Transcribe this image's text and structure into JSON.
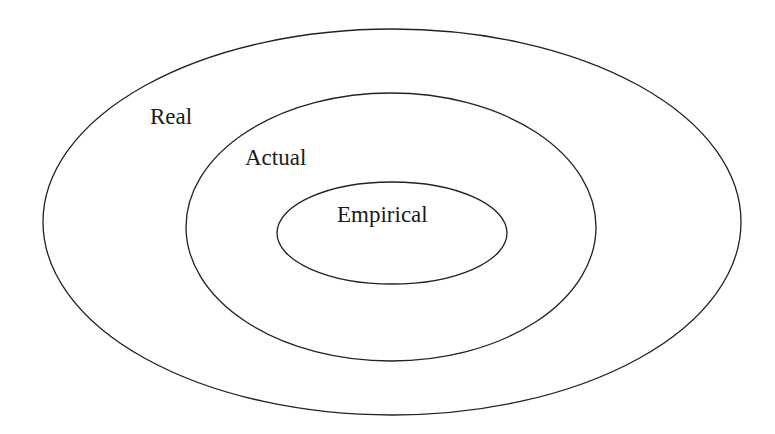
{
  "diagram": {
    "type": "nested-ellipses",
    "stroke_color": "#222222",
    "text_color": "#1a1a1a",
    "background": "#ffffff",
    "layers": [
      {
        "label": "Real",
        "cx": 392,
        "cy": 222,
        "rx": 349,
        "ry": 193,
        "label_x": 150,
        "label_y": 124
      },
      {
        "label": "Actual",
        "cx": 391,
        "cy": 227,
        "rx": 205,
        "ry": 134,
        "label_x": 245,
        "label_y": 165
      },
      {
        "label": "Empirical",
        "cx": 392,
        "cy": 233,
        "rx": 115,
        "ry": 51,
        "label_x": 337,
        "label_y": 222
      }
    ]
  }
}
